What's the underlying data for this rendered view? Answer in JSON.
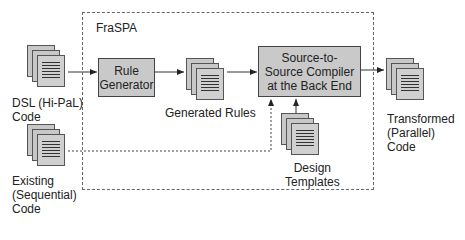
{
  "frame": {
    "label": "FraSPA"
  },
  "processes": {
    "rule_generator": "Rule Generator",
    "compiler": "Source-to-Source Compiler at the Back End"
  },
  "documents": {
    "dsl": {
      "line1": "DSL (Hi-PaL)",
      "line2": "Code"
    },
    "existing": {
      "line1": "Existing",
      "line2": "(Sequential)",
      "line3": "Code"
    },
    "generated": {
      "line1": "Generated Rules"
    },
    "design": {
      "line1": "Design",
      "line2": "Templates"
    },
    "transformed": {
      "line1": "Transformed",
      "line2": "(Parallel) Code"
    }
  },
  "icons": {
    "document_stack": "stacked-pages",
    "arrow": "arrowhead"
  },
  "colors": {
    "process_fill": "#c9c9c9",
    "page_fill": "#c8c8c8",
    "line": "#444444"
  }
}
